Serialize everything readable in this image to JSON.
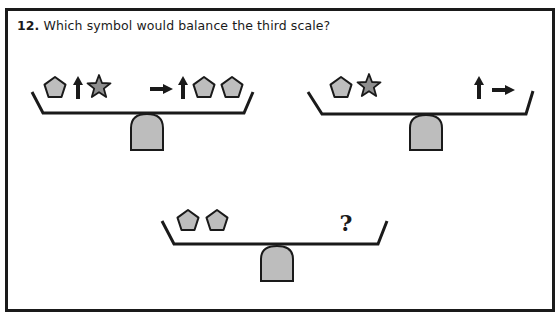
{
  "question": {
    "number": "12.",
    "text": "Which symbol would balance the third scale?"
  },
  "colors": {
    "shape_fill": "#bdbdbd",
    "star_fill": "#8f8f8f",
    "ink": "#1a1a1a",
    "frame": "#1a1a1a"
  },
  "scales": [
    {
      "id": "scale-1",
      "left_pan": [
        "pentagon",
        "arrow-up",
        "star"
      ],
      "right_pan": [
        "arrow-right",
        "arrow-up",
        "pentagon",
        "pentagon"
      ]
    },
    {
      "id": "scale-2",
      "left_pan": [
        "pentagon",
        "star"
      ],
      "right_pan": [
        "arrow-up",
        "arrow-right"
      ]
    },
    {
      "id": "scale-3",
      "left_pan": [
        "pentagon",
        "pentagon"
      ],
      "right_pan": [
        "question-mark"
      ],
      "unknown_label": "?"
    }
  ]
}
